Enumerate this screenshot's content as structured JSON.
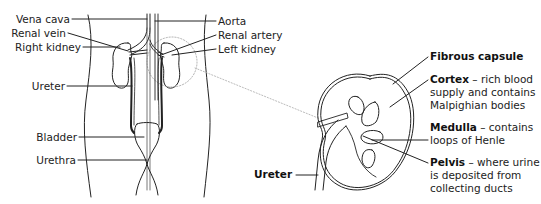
{
  "body_diagram": {
    "labels_left": [
      {
        "id": "vena-cava",
        "text": "Vena cava"
      },
      {
        "id": "renal-vein",
        "text": "Renal vein"
      },
      {
        "id": "right-kidney",
        "text": "Right kidney"
      },
      {
        "id": "ureter",
        "text": "Ureter"
      },
      {
        "id": "bladder",
        "text": "Bladder"
      },
      {
        "id": "urethra",
        "text": "Urethra"
      }
    ],
    "labels_right": [
      {
        "id": "aorta",
        "text": "Aorta"
      },
      {
        "id": "renal-artery",
        "text": "Renal artery"
      },
      {
        "id": "left-kidney",
        "text": "Left kidney"
      }
    ]
  },
  "kidney_section": {
    "labels": [
      {
        "id": "fibrous-capsule",
        "term": "Fibrous capsule",
        "desc": ""
      },
      {
        "id": "cortex",
        "term": "Cortex",
        "desc": " – rich blood supply and contains Malpighian bodies"
      },
      {
        "id": "medulla",
        "term": "Medulla",
        "desc": " – contains loops of Henle"
      },
      {
        "id": "pelvis",
        "term": "Pelvis",
        "desc": " – where urine is deposited from collecting ducts"
      }
    ],
    "ureter_label": "Ureter"
  }
}
